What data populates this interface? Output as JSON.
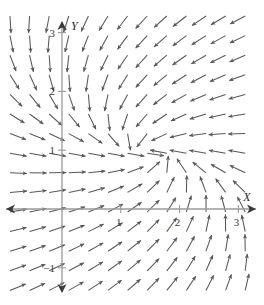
{
  "figure": {
    "title": "",
    "background_color": "#ffffff",
    "arrow_color": "#4a4a4a",
    "axis_color": "#9a9a9a",
    "axis_arrowhead_color": "#3a3a3a"
  },
  "axes": {
    "x_axis": {
      "label": "X",
      "ticks": [
        {
          "value": 1,
          "label": "1"
        },
        {
          "value": 2,
          "label": "2"
        },
        {
          "value": 3,
          "label": "3"
        }
      ],
      "range": [
        -1.05,
        3.45
      ],
      "arrowheads": "both"
    },
    "y_axis": {
      "label": "Y",
      "ticks": [
        {
          "value": 3,
          "label": "3"
        },
        {
          "value": 2,
          "label": "2"
        },
        {
          "value": 1,
          "label": "1"
        },
        {
          "value": -1,
          "label": "−1"
        }
      ],
      "range": [
        -1.5,
        3.25
      ],
      "arrowheads": "both"
    },
    "origin_px": {
      "x": 62,
      "y": 209
    },
    "unit_px": 58.8
  },
  "chart_data": {
    "type": "scatter",
    "plot_kind": "vector-field",
    "title": "",
    "xlabel": "X",
    "ylabel": "Y",
    "xlim": [
      -1.05,
      3.45
    ],
    "ylim": [
      -1.5,
      3.25
    ],
    "grid": false,
    "legend": null,
    "field": {
      "description": "Direction field of arrows on a regular grid; arrows converge/diverge about a critical point near (1.5, 0.95).",
      "critical_point": [
        1.5,
        0.95
      ],
      "u_expression": "(x - 1.5) * 0 + (0.95 - y)",
      "v_expression": "-(y - 0.95) * 0 - (x - 1.5)",
      "grid_step_units": 0.3333,
      "grid_step_px": 19.6,
      "arrow_length_px": 17,
      "columns": 14,
      "rows": 16
    },
    "tick_labels_x": [
      "1",
      "2",
      "3"
    ],
    "tick_labels_y": [
      "3",
      "2",
      "1",
      "−1"
    ]
  }
}
